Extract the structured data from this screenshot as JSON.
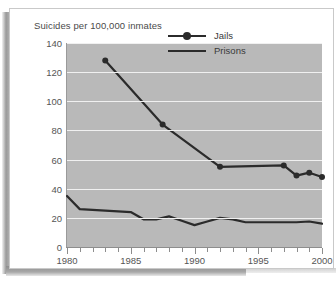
{
  "chart_data": {
    "type": "line",
    "title": "Suicides per 100,000 inmates",
    "xlabel": "",
    "ylabel": "",
    "xlim": [
      1980,
      2000
    ],
    "ylim": [
      0,
      140
    ],
    "ytick_step": 20,
    "yticks": [
      0,
      20,
      40,
      60,
      80,
      100,
      120,
      140
    ],
    "ytick_labels": [
      "0",
      "20",
      "40",
      "60",
      "80",
      "100",
      "120",
      "140"
    ],
    "xticks": [
      1980,
      1981,
      1982,
      1983,
      1984,
      1985,
      1986,
      1987,
      1988,
      1989,
      1990,
      1991,
      1992,
      1993,
      1994,
      1995,
      1996,
      1997,
      1998,
      1999,
      2000
    ],
    "xtick_labels_major": [
      "1980",
      "1985",
      "1990",
      "1995",
      "2000"
    ],
    "xticks_major": [
      1980,
      1985,
      1990,
      1995,
      2000
    ],
    "grid": true,
    "grid_color": "#f0f0f0",
    "plot_background": "#b9b9b9",
    "line_color": "#2b2b2b",
    "legend_position": "top-right",
    "series": [
      {
        "name": "Jails",
        "marker": "circle",
        "x": [
          1983,
          1987.5,
          1992,
          1997,
          1998,
          1999,
          2000
        ],
        "values": [
          128,
          84,
          55,
          56,
          49,
          51,
          48
        ]
      },
      {
        "name": "Prisons",
        "marker": "none",
        "x": [
          1980,
          1981,
          1982,
          1983,
          1984,
          1985,
          1986,
          1987,
          1988,
          1989,
          1990,
          1991,
          1992,
          1993,
          1994,
          1995,
          1996,
          1997,
          1998,
          1999,
          2000
        ],
        "values": [
          35,
          26,
          25.5,
          25,
          24.5,
          24,
          19,
          19,
          21,
          18,
          15,
          17.5,
          20,
          19,
          17,
          17,
          17,
          17,
          17,
          17.5,
          16
        ]
      }
    ]
  },
  "legend": {
    "items": [
      {
        "label": "Jails"
      },
      {
        "label": "Prisons"
      }
    ]
  }
}
